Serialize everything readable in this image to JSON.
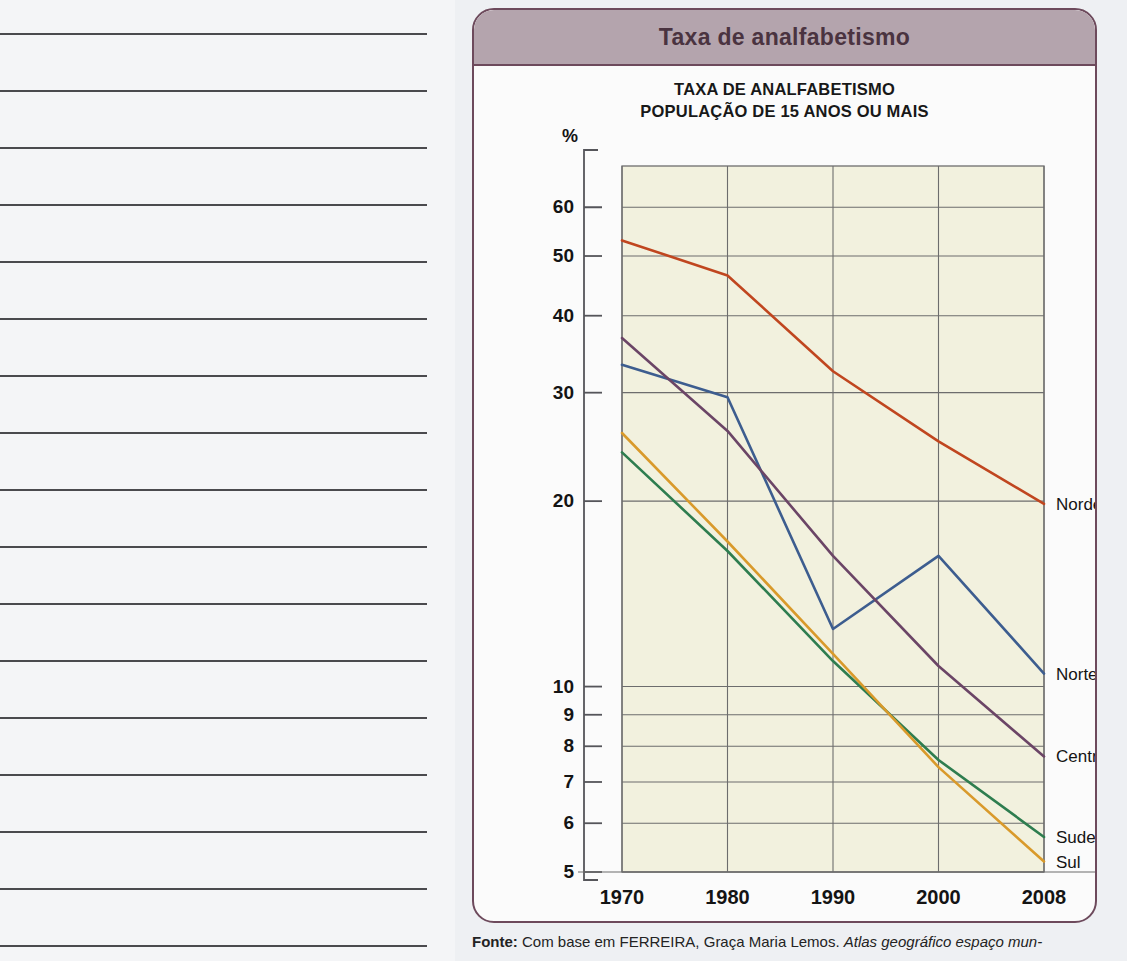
{
  "notebook": {
    "rule_count": 17,
    "rule_spacing": 57,
    "rule_top": 33,
    "rule_width": 427
  },
  "card": {
    "header_title": "Taxa de analfabetismo",
    "header_bg": "#b4a4ad",
    "header_border": "#6d4a5c",
    "header_text_color": "#4a3340",
    "body_bg": "#fbfbfb"
  },
  "source": {
    "label": "Fonte:",
    "text_plain": " Com base em FERREIRA, Graça Maria Lemos. ",
    "text_italic": "Atlas geográfico espaço mun-"
  },
  "chart_data": {
    "type": "line",
    "title": "TAXA DE ANALFABETISMO\nPOPULAÇÃO DE 15 ANOS OU MAIS",
    "title_line1": "TAXA DE ANALFABETISMO",
    "title_line2": "POPULAÇÃO DE 15 ANOS OU MAIS",
    "xlabel": "",
    "ylabel": "%",
    "yscale": "log",
    "ylim": [
      5,
      70
    ],
    "grid": true,
    "legend_position": "right-of-line-ends",
    "plot_bg": "#f2f1de",
    "x": [
      1970,
      1980,
      1990,
      2000,
      2008
    ],
    "categories": [
      "1970",
      "1980",
      "1990",
      "2000",
      "2008"
    ],
    "ytick_values": [
      60,
      50,
      40,
      30,
      20,
      10,
      9,
      8,
      7,
      6,
      5
    ],
    "ytick_labels": [
      "60",
      "50",
      "40",
      "30",
      "20",
      "10",
      "9",
      "8",
      "7",
      "6",
      "5"
    ],
    "series": [
      {
        "name": "Nordeste",
        "color": "#c0461f",
        "values": [
          53.0,
          46.5,
          32.5,
          25.0,
          19.8
        ]
      },
      {
        "name": "Norte",
        "color": "#3d5d8f",
        "values": [
          33.3,
          29.5,
          12.4,
          16.3,
          10.5
        ]
      },
      {
        "name": "Centro-Oeste",
        "color": "#6b4566",
        "values": [
          36.8,
          26.0,
          16.3,
          10.8,
          7.7
        ]
      },
      {
        "name": "Sudeste",
        "color": "#2e7d4f",
        "values": [
          24.0,
          16.6,
          11.0,
          7.6,
          5.7
        ]
      },
      {
        "name": "Sul",
        "color": "#d99a2b",
        "values": [
          25.8,
          17.2,
          11.3,
          7.4,
          5.2
        ]
      }
    ]
  }
}
